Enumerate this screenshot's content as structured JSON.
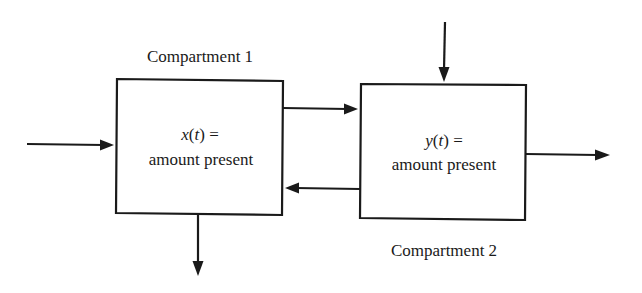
{
  "diagram": {
    "type": "two-compartment flow model",
    "compartments": [
      {
        "id": "compartment-1",
        "label": "Compartment 1",
        "variable": "x",
        "argument": "t",
        "equals": " =",
        "description": "amount present"
      },
      {
        "id": "compartment-2",
        "label": "Compartment 2",
        "variable": "y",
        "argument": "t",
        "equals": " =",
        "description": "amount present"
      }
    ],
    "flows": [
      {
        "id": "input-to-compartment-1",
        "from": "external",
        "to": "compartment-1",
        "direction": "right"
      },
      {
        "id": "compartment-1-to-compartment-2",
        "from": "compartment-1",
        "to": "compartment-2",
        "direction": "right"
      },
      {
        "id": "compartment-2-to-compartment-1",
        "from": "compartment-2",
        "to": "compartment-1",
        "direction": "left"
      },
      {
        "id": "compartment-1-output",
        "from": "compartment-1",
        "to": "external",
        "direction": "down"
      },
      {
        "id": "input-to-compartment-2",
        "from": "external",
        "to": "compartment-2",
        "direction": "down"
      },
      {
        "id": "compartment-2-output",
        "from": "compartment-2",
        "to": "external",
        "direction": "right"
      }
    ],
    "colors": {
      "stroke": "#1a1a1a",
      "background": "#ffffff"
    }
  },
  "text": {
    "paren_open": "(",
    "paren_close": ")"
  }
}
